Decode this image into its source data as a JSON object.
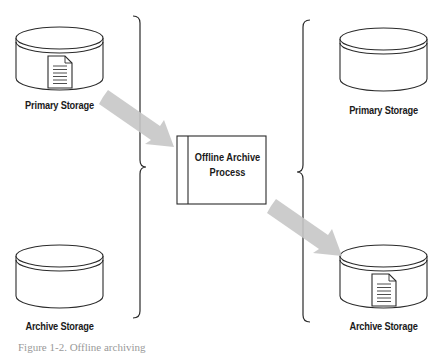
{
  "diagram": {
    "type": "flow",
    "left_group": {
      "primary_storage": {
        "label": "Primary Storage",
        "contains_document": true
      },
      "archive_storage": {
        "label": "Archive Storage",
        "contains_document": false
      }
    },
    "process": {
      "label_line1": "Offline Archive",
      "label_line2": "Process"
    },
    "right_group": {
      "primary_storage": {
        "label": "Primary Storage",
        "contains_document": false
      },
      "archive_storage": {
        "label": "Archive Storage",
        "contains_document": true
      }
    },
    "arrows": [
      {
        "from": "left_primary_storage",
        "to": "offline_archive_process"
      },
      {
        "from": "offline_archive_process",
        "to": "right_archive_storage"
      }
    ],
    "caption": "Figure 1-2. Offline archiving",
    "colors": {
      "stroke": "#2a2a2a",
      "arrow": "#c4c4c4",
      "background": "#ffffff"
    }
  }
}
